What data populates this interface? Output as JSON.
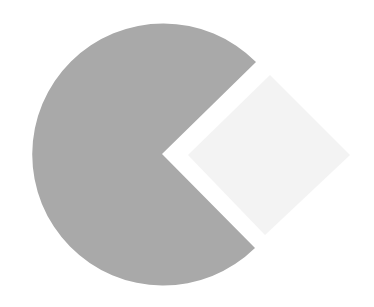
{
  "chart_data": {
    "type": "pie",
    "title": "",
    "categories": [
      "Slice A",
      "Slice B"
    ],
    "values": [
      76,
      24
    ],
    "units": "percent (estimated from slice angles)",
    "colors": [
      "#a9a9a9",
      "#f3f3f3"
    ],
    "legend": "none",
    "labels_visible": false,
    "layout": {
      "center": [
        159,
        153
      ],
      "radius": 131,
      "missing_wedge_apex": [
        162,
        154
      ],
      "missing_wedge_corners": [
        [
          256,
          62
        ],
        [
          255,
          248
        ]
      ],
      "exploded_segment_shape": "diamond",
      "exploded_segment_points": [
        [
          188,
          155
        ],
        [
          270,
          75
        ],
        [
          350,
          155
        ],
        [
          265,
          235
        ]
      ]
    }
  },
  "colors": {
    "background": "#ffffff",
    "main_slice": "#a9a9a9",
    "exploded_slice": "#f3f3f3"
  }
}
